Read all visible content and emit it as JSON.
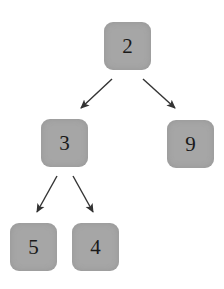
{
  "diagram": {
    "type": "binary-tree",
    "nodes": [
      {
        "id": "n2",
        "label": "2",
        "x": 104,
        "y": 22
      },
      {
        "id": "n3",
        "label": "3",
        "x": 41,
        "y": 119
      },
      {
        "id": "n9",
        "label": "9",
        "x": 167,
        "y": 120
      },
      {
        "id": "n5",
        "label": "5",
        "x": 10,
        "y": 223
      },
      {
        "id": "n4",
        "label": "4",
        "x": 72,
        "y": 223
      }
    ],
    "edges": [
      {
        "from": "2",
        "to": "3"
      },
      {
        "from": "2",
        "to": "9"
      },
      {
        "from": "3",
        "to": "5"
      },
      {
        "from": "3",
        "to": "4"
      }
    ],
    "colors": {
      "node_fill": "#a6a6a6",
      "edge": "#333333",
      "text": "#1a1a1a"
    }
  }
}
